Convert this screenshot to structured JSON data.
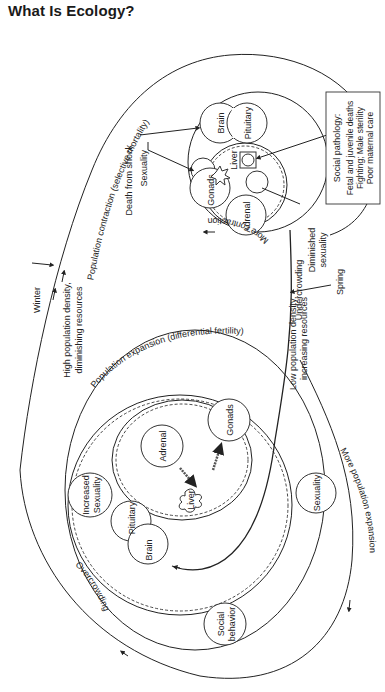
{
  "page": {
    "title": "What Is Ecology?"
  },
  "diagram": {
    "outer_loop": {
      "winter": "Winter",
      "spring": "Spring",
      "high_density_line1": "High population density,",
      "high_density_line2": "diminishing resources",
      "low_density_line1": "Low population density,",
      "low_density_line2": "increasing resources",
      "contraction_label": "Population contraction (selective mortality)",
      "expansion_label": "Population expansion (differential fertility)",
      "overcrowding": "Overcrowding",
      "undercrowding": "Undercrowding",
      "more_contraction": "More contraction",
      "more_expansion": "More population expansion"
    },
    "contraction_cycle": {
      "nodes": {
        "brain": "Brain",
        "pituitary": "Pituitary",
        "liver": "Liver",
        "gonads": "Gonads",
        "adrenal": "Adrenal"
      },
      "callouts": {
        "death_from_shock": "Death from shock",
        "sexuality": "Sexuality",
        "diminished_sexuality_line1": "Diminished",
        "diminished_sexuality_line2": "sexuality"
      },
      "social_pathology_box": {
        "title": "Social pathology:",
        "items": [
          "Fetal and juvenile deaths",
          "Fighting; Male sterility",
          "Poor maternal care"
        ]
      }
    },
    "expansion_cycle": {
      "nodes": {
        "brain": "Brain",
        "pituitary": "Pituitary",
        "adrenal": "Adrenal",
        "gonads": "Gonads",
        "liver": "Liver",
        "increased_sexuality_line1": "Increased",
        "increased_sexuality_line2": "Sexuality",
        "sexuality": "Sexuality",
        "social_behavior_line1": "Social",
        "social_behavior_line2": "behavior"
      }
    }
  }
}
